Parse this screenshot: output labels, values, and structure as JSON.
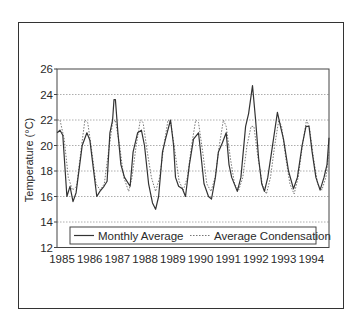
{
  "chart_data": {
    "type": "line",
    "title": "",
    "xlabel": "",
    "ylabel": "Temperature (°C)",
    "ylim": [
      12,
      26
    ],
    "xlim": [
      1984.9,
      1994.71
    ],
    "grid": "horizontal dotted",
    "legend_position": "bottom inside",
    "y_ticks": [
      12,
      14,
      16,
      18,
      20,
      22,
      24,
      26
    ],
    "x_tick_labels": [
      "1985",
      "1986",
      "1987",
      "1988",
      "1989",
      "1990",
      "1991",
      "1992",
      "1993",
      "1994"
    ],
    "series": [
      {
        "name": "Monthly Average",
        "style": "solid",
        "color": "#333333",
        "points": [
          [
            1984.9,
            21.0
          ],
          [
            1985.0,
            21.2
          ],
          [
            1985.1,
            20.8
          ],
          [
            1985.25,
            16.0
          ],
          [
            1985.36,
            16.8
          ],
          [
            1985.47,
            15.6
          ],
          [
            1985.58,
            16.3
          ],
          [
            1985.8,
            20.0
          ],
          [
            1985.97,
            21.0
          ],
          [
            1986.08,
            20.4
          ],
          [
            1986.33,
            16.0
          ],
          [
            1986.44,
            16.4
          ],
          [
            1986.59,
            16.8
          ],
          [
            1986.7,
            17.2
          ],
          [
            1986.8,
            21.0
          ],
          [
            1986.9,
            22.0
          ],
          [
            1986.95,
            23.6
          ],
          [
            1987.0,
            23.6
          ],
          [
            1987.09,
            21.0
          ],
          [
            1987.2,
            18.5
          ],
          [
            1987.33,
            17.5
          ],
          [
            1987.53,
            16.8
          ],
          [
            1987.64,
            19.5
          ],
          [
            1987.8,
            21.0
          ],
          [
            1987.94,
            21.2
          ],
          [
            1988.05,
            20.0
          ],
          [
            1988.2,
            17.0
          ],
          [
            1988.34,
            15.5
          ],
          [
            1988.45,
            15.0
          ],
          [
            1988.56,
            16.0
          ],
          [
            1988.7,
            19.5
          ],
          [
            1988.81,
            20.5
          ],
          [
            1988.99,
            22.0
          ],
          [
            1989.1,
            20.0
          ],
          [
            1989.17,
            17.5
          ],
          [
            1989.28,
            16.8
          ],
          [
            1989.42,
            16.6
          ],
          [
            1989.53,
            16.0
          ],
          [
            1989.67,
            18.5
          ],
          [
            1989.82,
            20.5
          ],
          [
            1990.0,
            21.0
          ],
          [
            1990.1,
            19.0
          ],
          [
            1990.2,
            17.0
          ],
          [
            1990.36,
            16.0
          ],
          [
            1990.47,
            15.8
          ],
          [
            1990.61,
            17.5
          ],
          [
            1990.72,
            19.5
          ],
          [
            1990.86,
            20.2
          ],
          [
            1991.0,
            21.0
          ],
          [
            1991.1,
            18.5
          ],
          [
            1991.2,
            17.5
          ],
          [
            1991.4,
            16.4
          ],
          [
            1991.53,
            17.5
          ],
          [
            1991.7,
            21.5
          ],
          [
            1991.81,
            22.5
          ],
          [
            1991.95,
            24.7
          ],
          [
            1992.06,
            22.0
          ],
          [
            1992.17,
            19.0
          ],
          [
            1992.28,
            17.0
          ],
          [
            1992.38,
            16.4
          ],
          [
            1992.5,
            17.5
          ],
          [
            1992.64,
            19.5
          ],
          [
            1992.74,
            21.0
          ],
          [
            1992.85,
            22.6
          ],
          [
            1992.96,
            21.5
          ],
          [
            1993.07,
            20.5
          ],
          [
            1993.25,
            18.0
          ],
          [
            1993.43,
            16.6
          ],
          [
            1993.57,
            17.5
          ],
          [
            1993.74,
            20.0
          ],
          [
            1993.88,
            21.5
          ],
          [
            1993.99,
            21.5
          ],
          [
            1994.1,
            19.5
          ],
          [
            1994.24,
            17.5
          ],
          [
            1994.39,
            16.5
          ],
          [
            1994.53,
            17.5
          ],
          [
            1994.64,
            18.5
          ],
          [
            1994.71,
            20.6
          ]
        ]
      },
      {
        "name": "Average Condensation",
        "style": "dotted",
        "color": "#666666",
        "points": [
          [
            1984.9,
            22.0
          ],
          [
            1985.0,
            22.0
          ],
          [
            1985.15,
            20.5
          ],
          [
            1985.3,
            17.5
          ],
          [
            1985.45,
            16.5
          ],
          [
            1985.6,
            16.8
          ],
          [
            1985.75,
            19.5
          ],
          [
            1985.9,
            22.0
          ],
          [
            1986.0,
            21.8
          ],
          [
            1986.15,
            19.5
          ],
          [
            1986.3,
            17.0
          ],
          [
            1986.45,
            16.5
          ],
          [
            1986.6,
            17.0
          ],
          [
            1986.75,
            19.5
          ],
          [
            1986.9,
            21.8
          ],
          [
            1987.0,
            22.0
          ],
          [
            1987.15,
            20.0
          ],
          [
            1987.3,
            17.5
          ],
          [
            1987.48,
            16.4
          ],
          [
            1987.6,
            17.5
          ],
          [
            1987.75,
            20.0
          ],
          [
            1987.9,
            22.0
          ],
          [
            1988.0,
            21.8
          ],
          [
            1988.15,
            19.5
          ],
          [
            1988.3,
            17.5
          ],
          [
            1988.45,
            16.4
          ],
          [
            1988.6,
            17.5
          ],
          [
            1988.75,
            20.0
          ],
          [
            1988.9,
            22.0
          ],
          [
            1989.0,
            21.8
          ],
          [
            1989.15,
            19.5
          ],
          [
            1989.3,
            17.2
          ],
          [
            1989.45,
            16.5
          ],
          [
            1989.6,
            17.5
          ],
          [
            1989.75,
            20.0
          ],
          [
            1989.9,
            22.0
          ],
          [
            1990.0,
            21.8
          ],
          [
            1990.15,
            19.5
          ],
          [
            1990.3,
            17.0
          ],
          [
            1990.45,
            16.4
          ],
          [
            1990.6,
            17.5
          ],
          [
            1990.75,
            20.0
          ],
          [
            1990.9,
            22.0
          ],
          [
            1991.0,
            21.5
          ],
          [
            1991.15,
            19.0
          ],
          [
            1991.3,
            17.0
          ],
          [
            1991.45,
            16.5
          ],
          [
            1991.6,
            17.5
          ],
          [
            1991.75,
            20.0
          ],
          [
            1991.9,
            21.5
          ],
          [
            1992.0,
            21.5
          ],
          [
            1992.15,
            19.0
          ],
          [
            1992.3,
            17.0
          ],
          [
            1992.45,
            16.2
          ],
          [
            1992.6,
            17.5
          ],
          [
            1992.75,
            20.0
          ],
          [
            1992.9,
            22.0
          ],
          [
            1993.0,
            21.5
          ],
          [
            1993.15,
            19.0
          ],
          [
            1993.3,
            17.0
          ],
          [
            1993.45,
            16.2
          ],
          [
            1993.6,
            17.5
          ],
          [
            1993.75,
            20.0
          ],
          [
            1993.9,
            22.0
          ],
          [
            1994.0,
            21.5
          ],
          [
            1994.15,
            19.0
          ],
          [
            1994.3,
            17.0
          ],
          [
            1994.45,
            16.5
          ],
          [
            1994.6,
            17.5
          ],
          [
            1994.71,
            19.5
          ]
        ]
      }
    ]
  },
  "legend": {
    "items": [
      {
        "label": "Monthly Average",
        "style": "solid"
      },
      {
        "label": "Average Condensation",
        "style": "dotted"
      }
    ]
  },
  "axis": {
    "ylabel": "Temperature (°C)"
  }
}
